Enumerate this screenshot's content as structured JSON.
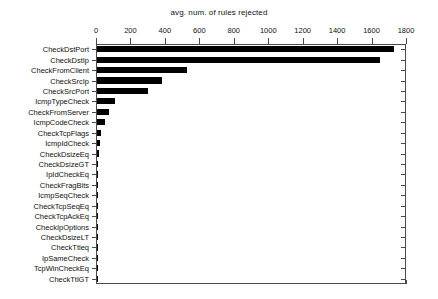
{
  "chart_data": {
    "type": "bar",
    "orientation": "horizontal",
    "title": "avg. num. of rules rejected",
    "xlabel": "",
    "ylabel": "",
    "xlim": [
      0,
      1800
    ],
    "xticks": [
      0,
      200,
      400,
      600,
      800,
      1000,
      1200,
      1400,
      1600,
      1800
    ],
    "xtick_labels": [
      "0",
      "200",
      "400",
      "600",
      "800",
      "1000",
      "1200",
      "1400",
      "1600",
      "1800"
    ],
    "grid": false,
    "legend": null,
    "axis_position": "top",
    "bar_color": "#000000",
    "categories": [
      "CheckDstPort",
      "CheckDstIp",
      "CheckFromClient",
      "CheckSrcIp",
      "CheckSrcPort",
      "IcmpTypeCheck",
      "CheckFromServer",
      "IcmpCodeCheck",
      "CheckTcpFlags",
      "IcmpIdCheck",
      "CheckDsizeEq",
      "CheckDsizeGT",
      "IpIdCheckEq",
      "CheckFragBits",
      "IcmpSeqCheck",
      "CheckTcpSeqEq",
      "CheckTcpAckEq",
      "CheckIpOptions",
      "CheckDsizeLT",
      "CheckTtleq",
      "IpSameCheck",
      "TcpWinCheckEq",
      "CheckTtlGT"
    ],
    "values": [
      1725,
      1645,
      520,
      378,
      295,
      105,
      72,
      48,
      25,
      18,
      14,
      7,
      3,
      3,
      2,
      2,
      2,
      1,
      1,
      1,
      1,
      1,
      1
    ]
  }
}
